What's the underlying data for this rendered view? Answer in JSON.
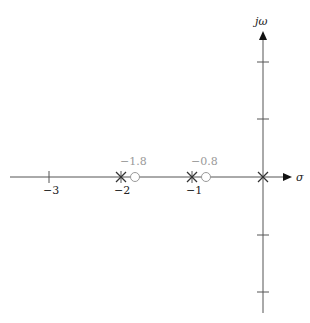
{
  "diagram": {
    "type": "pole-zero plot (s-plane)",
    "axes": {
      "x_label": "σ",
      "y_label": "jω",
      "x_ticks": [
        {
          "value": -3,
          "label": "−3"
        },
        {
          "value": -2,
          "label": "−2"
        },
        {
          "value": -1,
          "label": "−1"
        }
      ],
      "y_tick_count": 4
    },
    "poles": [
      {
        "re": -2,
        "im": 0
      },
      {
        "re": -1,
        "im": 0
      },
      {
        "re": 0,
        "im": 0
      }
    ],
    "zeros": [
      {
        "re": -1.8,
        "im": 0,
        "label": "−1.8"
      },
      {
        "re": -0.8,
        "im": 0,
        "label": "−0.8"
      }
    ],
    "colors": {
      "axis": "#555555",
      "pole": "#333333",
      "zero": "#9a9a9a",
      "zero_label": "#9a9a9a"
    }
  }
}
